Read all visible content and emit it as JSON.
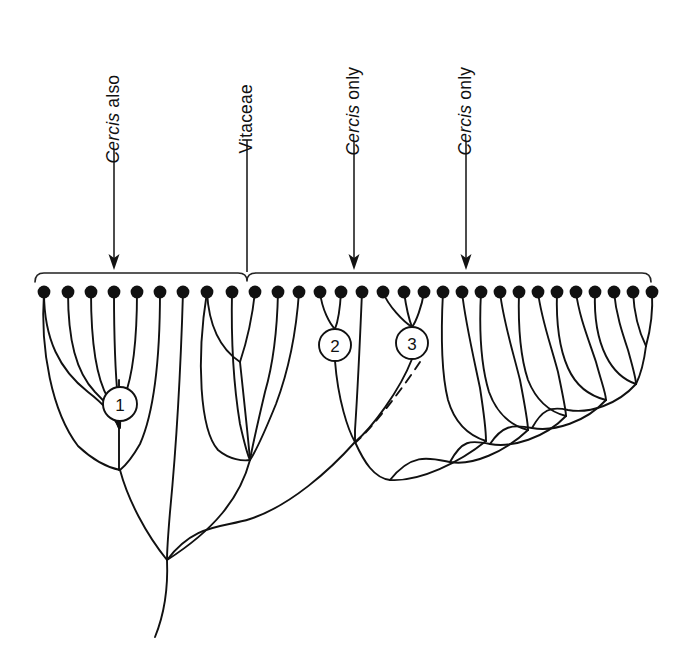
{
  "figure": {
    "background_color": "#ffffff",
    "line_color": "#111111"
  },
  "annotations": [
    {
      "id": "ann-1",
      "italic_text": "Cercis",
      "plain_text": " also",
      "full_text": "Cercis also",
      "marker": "arrow",
      "x": 114,
      "label_baseline_y": 160,
      "leader_top_y": 150,
      "leader_bottom_y": 268
    },
    {
      "id": "ann-2",
      "italic_text": "",
      "plain_text": "Vitaceae",
      "full_text": "Vitaceae",
      "marker": "tick",
      "x": 247,
      "label_baseline_y": 150,
      "leader_top_y": 140,
      "leader_bottom_y": 272
    },
    {
      "id": "ann-3",
      "italic_text": "Cercis",
      "plain_text": " only",
      "full_text": "Cercis only",
      "marker": "arrow",
      "x": 354,
      "label_baseline_y": 152,
      "leader_top_y": 142,
      "leader_bottom_y": 268
    },
    {
      "id": "ann-4",
      "italic_text": "Cercis",
      "plain_text": " only",
      "full_text": "Cercis only",
      "marker": "arrow",
      "x": 466,
      "label_baseline_y": 152,
      "leader_top_y": 142,
      "leader_bottom_y": 268
    }
  ],
  "bracket": {
    "name": "taxon-span-bracket",
    "left_x": 35,
    "right_x": 651,
    "y": 273,
    "cusp_x": 247,
    "curl": 9
  },
  "nodes": [
    {
      "label": "1",
      "cx": 120,
      "cy": 404,
      "r": 17
    },
    {
      "label": "2",
      "cx": 335,
      "cy": 345,
      "r": 16
    },
    {
      "label": "3",
      "cx": 412,
      "cy": 343,
      "r": 16
    }
  ],
  "tips": {
    "count": 30,
    "dot_radius": 6.4,
    "y": 292,
    "x_positions": [
      44,
      68,
      91,
      114,
      137,
      160,
      183,
      207,
      232,
      255,
      278,
      299,
      320,
      341,
      362,
      383,
      404,
      424,
      443,
      462,
      481,
      500,
      519,
      538,
      557,
      576,
      595,
      614,
      633,
      652
    ]
  },
  "root": {
    "x": 167,
    "y": 560,
    "tail_end_x": 155,
    "tail_end_y": 637
  }
}
